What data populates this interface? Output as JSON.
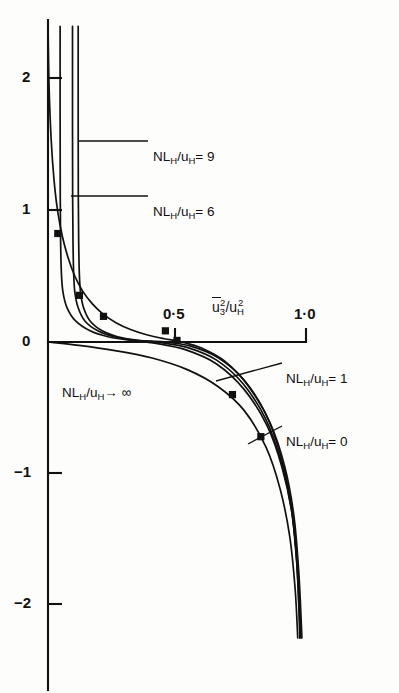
{
  "chart_data": {
    "type": "line",
    "title": "",
    "xlabel": "u̅3²/u_H²",
    "ylabel": "",
    "xlim": [
      0,
      1.05
    ],
    "ylim": [
      -2.25,
      2.4
    ],
    "grid": false,
    "legend_position": "inline-leader-labels",
    "x_ticks": [
      {
        "value": 0.5,
        "label": "0·5"
      },
      {
        "value": 1.0,
        "label": "1·0"
      }
    ],
    "y_ticks": [
      {
        "value": 2,
        "label": "2"
      },
      {
        "value": 1,
        "label": "1"
      },
      {
        "value": 0,
        "label": "0"
      },
      {
        "value": -1,
        "label": "−1"
      },
      {
        "value": -2,
        "label": "−2"
      }
    ],
    "axis_label_parts": {
      "base": "u",
      "overbar": true,
      "sub1": "3",
      "sup1": "2",
      "slash": "/",
      "base2": "u",
      "sub2": "H",
      "sup2": "2"
    },
    "series": [
      {
        "name": "NL_H/u_H = 9",
        "label": "NL",
        "label_sub": "H",
        "label_mid": "/u",
        "label_sub2": "H",
        "label_tail": "= 9",
        "points": [
          [
            0.117,
            2.4
          ],
          [
            0.117,
            1.7
          ],
          [
            0.1175,
            1.1
          ],
          [
            0.119,
            0.75
          ],
          [
            0.1215,
            0.52
          ],
          [
            0.126,
            0.38
          ],
          [
            0.138,
            0.26
          ],
          [
            0.163,
            0.16
          ],
          [
            0.21,
            0.085
          ],
          [
            0.27,
            0.04
          ],
          [
            0.35,
            0.012
          ],
          [
            0.45,
            0.0
          ],
          [
            0.55,
            -0.03
          ],
          [
            0.66,
            -0.12
          ],
          [
            0.76,
            -0.29
          ],
          [
            0.845,
            -0.55
          ],
          [
            0.9,
            -0.85
          ],
          [
            0.94,
            -1.2
          ],
          [
            0.962,
            -1.6
          ],
          [
            0.972,
            -2.0
          ],
          [
            0.976,
            -2.25
          ]
        ]
      },
      {
        "name": "NL_H/u_H = 6",
        "label": "NL",
        "label_sub": "H",
        "label_mid": "/u",
        "label_sub2": "H",
        "label_tail": "= 6",
        "points": [
          [
            0.095,
            2.4
          ],
          [
            0.095,
            1.7
          ],
          [
            0.0955,
            1.1
          ],
          [
            0.097,
            0.75
          ],
          [
            0.0995,
            0.52
          ],
          [
            0.104,
            0.38
          ],
          [
            0.117,
            0.26
          ],
          [
            0.143,
            0.16
          ],
          [
            0.193,
            0.085
          ],
          [
            0.256,
            0.04
          ],
          [
            0.34,
            0.012
          ],
          [
            0.44,
            -0.005
          ],
          [
            0.545,
            -0.045
          ],
          [
            0.655,
            -0.14
          ],
          [
            0.757,
            -0.32
          ],
          [
            0.845,
            -0.59
          ],
          [
            0.902,
            -0.9
          ],
          [
            0.942,
            -1.25
          ],
          [
            0.963,
            -1.65
          ],
          [
            0.974,
            -2.05
          ],
          [
            0.977,
            -2.25
          ]
        ]
      },
      {
        "name": "NL_H/u_H = 1",
        "label": "NL",
        "label_sub": "H",
        "label_mid": "/u",
        "label_sub2": "H",
        "label_tail": "= 1",
        "points": [
          [
            0.047,
            2.4
          ],
          [
            0.047,
            1.7
          ],
          [
            0.0475,
            1.1
          ],
          [
            0.049,
            0.75
          ],
          [
            0.052,
            0.52
          ],
          [
            0.058,
            0.38
          ],
          [
            0.074,
            0.26
          ],
          [
            0.107,
            0.16
          ],
          [
            0.163,
            0.085
          ],
          [
            0.232,
            0.04
          ],
          [
            0.32,
            0.012
          ],
          [
            0.425,
            -0.012
          ],
          [
            0.535,
            -0.06
          ],
          [
            0.652,
            -0.165
          ],
          [
            0.76,
            -0.36
          ],
          [
            0.85,
            -0.64
          ],
          [
            0.908,
            -0.96
          ],
          [
            0.947,
            -1.32
          ],
          [
            0.967,
            -1.72
          ],
          [
            0.978,
            -2.1
          ],
          [
            0.981,
            -2.25
          ]
        ]
      },
      {
        "name": "NL_H/u_H = 0",
        "label": "NL",
        "label_sub": "H",
        "label_mid": "/u",
        "label_sub2": "H",
        "label_tail": "= 0",
        "points": [
          [
            0.0,
            2.4
          ],
          [
            0.004,
            1.95
          ],
          [
            0.012,
            1.55
          ],
          [
            0.023,
            1.24
          ],
          [
            0.037,
            1.0
          ],
          [
            0.056,
            0.8
          ],
          [
            0.078,
            0.64
          ],
          [
            0.104,
            0.5
          ],
          [
            0.135,
            0.385
          ],
          [
            0.172,
            0.29
          ],
          [
            0.215,
            0.21
          ],
          [
            0.265,
            0.145
          ],
          [
            0.32,
            0.095
          ],
          [
            0.382,
            0.055
          ],
          [
            0.45,
            0.025
          ],
          [
            0.52,
            0.0
          ],
          [
            0.6,
            -0.05
          ],
          [
            0.685,
            -0.145
          ],
          [
            0.775,
            -0.33
          ],
          [
            0.862,
            -0.62
          ],
          [
            0.918,
            -0.95
          ],
          [
            0.953,
            -1.32
          ],
          [
            0.972,
            -1.75
          ],
          [
            0.982,
            -2.15
          ],
          [
            0.984,
            -2.25
          ]
        ]
      },
      {
        "name": "NL_H/u_H → ∞",
        "label": "NL",
        "label_sub": "H",
        "label_mid": "/u",
        "label_sub2": "H",
        "label_tail": "→ ∞",
        "points": [
          [
            0.0,
            0.0
          ],
          [
            0.12,
            -0.025
          ],
          [
            0.26,
            -0.065
          ],
          [
            0.4,
            -0.12
          ],
          [
            0.54,
            -0.21
          ],
          [
            0.66,
            -0.34
          ],
          [
            0.76,
            -0.52
          ],
          [
            0.845,
            -0.8
          ],
          [
            0.9,
            -1.12
          ],
          [
            0.937,
            -1.48
          ],
          [
            0.958,
            -1.88
          ],
          [
            0.968,
            -2.25
          ]
        ]
      }
    ],
    "data_points": [
      {
        "x": 0.038,
        "y": 0.825
      },
      {
        "x": 0.122,
        "y": 0.355
      },
      {
        "x": 0.215,
        "y": 0.195
      },
      {
        "x": 0.455,
        "y": 0.085
      },
      {
        "x": 0.5,
        "y": 0.012
      },
      {
        "x": 0.715,
        "y": -0.4
      },
      {
        "x": 0.825,
        "y": -0.72
      }
    ],
    "annotations": [
      {
        "id": "label-nl9",
        "text": "NL_H/u_H = 9",
        "text_x": 153,
        "text_y": 147,
        "leader": {
          "x1": 78,
          "y1": 141,
          "x2": 148,
          "y2": 141
        }
      },
      {
        "id": "label-nl6",
        "text": "NL_H/u_H = 6",
        "text_x": 153,
        "text_y": 202,
        "leader": {
          "x1": 71,
          "y1": 196,
          "x2": 148,
          "y2": 196
        }
      },
      {
        "id": "label-nl1",
        "text": "NL_H/u_H = 1",
        "text_x": 286,
        "text_y": 369,
        "leader": {
          "x1": 216,
          "y1": 381,
          "x2": 282,
          "y2": 363
        }
      },
      {
        "id": "label-nl0",
        "text": "NL_H/u_H = 0",
        "text_x": 286,
        "text_y": 432,
        "leader": {
          "x1": 248,
          "y1": 444,
          "x2": 282,
          "y2": 426
        }
      },
      {
        "id": "label-nlinf",
        "text": "NL_H/u_H → ∞",
        "text_x": 62,
        "text_y": 383
      }
    ]
  },
  "axes": {
    "origin_px": {
      "x": 48,
      "y": 342
    },
    "x_unit_px": 258,
    "y_unit_px": 131.5,
    "y_top_px": 20,
    "y_bottom_px": 690,
    "x_right_px": 306
  }
}
